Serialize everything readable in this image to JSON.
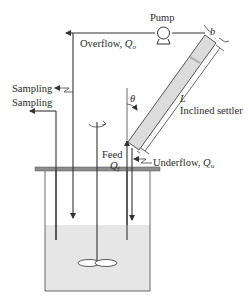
{
  "diagram": {
    "type": "process schematic",
    "labels": {
      "pump": "Pump",
      "overflow": "Overflow, ",
      "overflow_symbol": "Q",
      "overflow_sub": "o",
      "sampling_top": "Sampling",
      "sampling_bottom": "Sampling",
      "theta": "θ",
      "length": "L",
      "width": "b",
      "settler": "Inclined settler",
      "feed": "Feed",
      "feed_symbol": "Q",
      "feed_sub": "f",
      "underflow": "Underflow, ",
      "underflow_symbol": "Q",
      "underflow_sub": "u"
    },
    "colors": {
      "line": "#333333",
      "liquid": "#e6e6e6",
      "settler_fill": "#dcdcdc",
      "lid": "#8c8c8c"
    }
  }
}
